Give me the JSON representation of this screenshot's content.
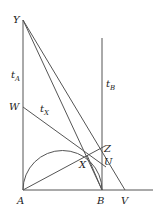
{
  "diagram": {
    "type": "geometry",
    "points": {
      "Y": {
        "label": "Y",
        "x": 23,
        "y": 20
      },
      "A": {
        "label": "A",
        "x": 23,
        "y": 190
      },
      "B": {
        "label": "B",
        "x": 102,
        "y": 190
      },
      "V": {
        "label": "V",
        "x": 125,
        "y": 190
      },
      "W": {
        "label": "W",
        "x": 23,
        "y": 107
      },
      "X": {
        "label": "X",
        "x": 87,
        "y": 155
      },
      "Z": {
        "label": "Z",
        "x": 102,
        "y": 148
      },
      "U": {
        "label": "U",
        "x": 102,
        "y": 160
      }
    },
    "line_labels": {
      "tA": {
        "main": "t",
        "sub": "A"
      },
      "tB": {
        "main": "t",
        "sub": "B"
      },
      "tX": {
        "main": "t",
        "sub": "X"
      }
    },
    "colors": {
      "line": "#555555",
      "text": "#222222",
      "background": "#ffffff"
    }
  }
}
